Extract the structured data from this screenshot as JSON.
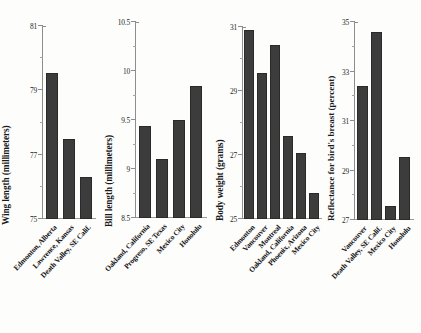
{
  "chart_data": [
    {
      "type": "bar",
      "title": "",
      "xlabel": "",
      "ylabel": "Wing length (millimeters)",
      "ylim": [
        75,
        81
      ],
      "yticks": [
        75,
        77,
        79,
        81
      ],
      "yticklabels": [
        "75",
        "77",
        "79",
        "81"
      ],
      "yminorticks": [
        76,
        78,
        80
      ],
      "grid": false,
      "legend": null,
      "categories": [
        "Edmonton, Alberta",
        "Lawrence, Kansas",
        "Death Valley, SE Calif."
      ],
      "values": [
        79.55,
        77.5,
        76.3
      ]
    },
    {
      "type": "bar",
      "title": "",
      "xlabel": "",
      "ylabel": "Bill length (millimeters)",
      "ylim": [
        8.5,
        10.5
      ],
      "yticks": [
        8.5,
        9,
        9.5,
        10,
        10.5
      ],
      "yticklabels": [
        "8.5",
        "9",
        "9.5",
        "10",
        "10.5"
      ],
      "yminorticks": [
        8.75,
        9.25,
        9.75,
        10.25
      ],
      "grid": false,
      "legend": null,
      "categories": [
        "Oakland, California",
        "Progreso, SE Texas",
        "Mexico City",
        "Honolulu"
      ],
      "values": [
        9.44,
        9.1,
        9.5,
        9.85
      ]
    },
    {
      "type": "bar",
      "title": "",
      "xlabel": "",
      "ylabel": "Body weight (grams)",
      "ylim": [
        25,
        31
      ],
      "yticks": [
        25,
        27,
        29,
        31
      ],
      "yticklabels": [
        "25",
        "27",
        "29",
        "31"
      ],
      "yminorticks": [
        26,
        28,
        30
      ],
      "grid": false,
      "legend": null,
      "categories": [
        "Edmonton",
        "Vancouver",
        "Montreal",
        "Oakland, California",
        "Phoenix, Arizona",
        "Mexico City"
      ],
      "values": [
        30.9,
        29.55,
        30.45,
        27.6,
        27.05,
        25.8
      ]
    },
    {
      "type": "bar",
      "title": "",
      "xlabel": "",
      "ylabel": "Reflectance for bird's breast (percent)",
      "ylim": [
        27,
        35
      ],
      "yticks": [
        27,
        29,
        31,
        33,
        35
      ],
      "yticklabels": [
        "27",
        "29",
        "31",
        "33",
        "35"
      ],
      "yminorticks": [
        28,
        30,
        32,
        34
      ],
      "grid": false,
      "legend": null,
      "categories": [
        "Vancouver",
        "Death Valley, SE Calif.",
        "Mexico City",
        "Honolulu"
      ],
      "values": [
        32.4,
        34.6,
        27.55,
        29.55
      ]
    }
  ],
  "style": {
    "bar_color": "#3c3c3c",
    "axis_color": "#8d8d8d",
    "text_color": "#161616",
    "background": "#fdfdfc"
  }
}
